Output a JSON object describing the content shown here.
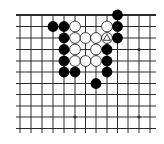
{
  "board": {
    "title": "Go problem diagram",
    "columns": 13,
    "rows": 11,
    "top_edge": true,
    "col_x": [
      20,
      31,
      42,
      53,
      64,
      75,
      85.5,
      96,
      107,
      117.5,
      128,
      139,
      150
    ],
    "row_y": [
      15,
      26.5,
      38,
      49.5,
      61,
      72,
      83.5,
      94.5,
      106,
      117,
      128.5
    ],
    "line_extent": {
      "x_start": 16,
      "x_end": 156,
      "y_end": 133
    },
    "colors": {
      "background": "#ffffff",
      "line": "#2a2a2a",
      "black_stone": "#000000",
      "white_stone": "#ffffff",
      "stone_outline": "#111111"
    },
    "stone_radius": 5.4
  },
  "star_points": [
    {
      "col": 11,
      "row": 3
    },
    {
      "col": 5,
      "row": 9
    },
    {
      "col": 11,
      "row": 9
    }
  ],
  "black_stones": [
    {
      "col": 9,
      "row": 0
    },
    {
      "col": 3,
      "row": 1
    },
    {
      "col": 4,
      "row": 1
    },
    {
      "col": 9,
      "row": 1
    },
    {
      "col": 4,
      "row": 2
    },
    {
      "col": 9,
      "row": 2
    },
    {
      "col": 4,
      "row": 3
    },
    {
      "col": 8,
      "row": 3
    },
    {
      "col": 4,
      "row": 4
    },
    {
      "col": 8,
      "row": 4
    },
    {
      "col": 4,
      "row": 5
    },
    {
      "col": 5,
      "row": 5
    },
    {
      "col": 8,
      "row": 5
    },
    {
      "col": 7,
      "row": 6
    }
  ],
  "white_stones": [
    {
      "col": 5,
      "row": 1
    },
    {
      "col": 8,
      "row": 1
    },
    {
      "col": 5,
      "row": 2
    },
    {
      "col": 6,
      "row": 2
    },
    {
      "col": 7,
      "row": 2
    },
    {
      "col": 8,
      "row": 2,
      "mark": "triangle"
    },
    {
      "col": 5,
      "row": 3
    },
    {
      "col": 7,
      "row": 3
    },
    {
      "col": 5,
      "row": 4
    },
    {
      "col": 6,
      "row": 4
    },
    {
      "col": 7,
      "row": 4
    }
  ]
}
